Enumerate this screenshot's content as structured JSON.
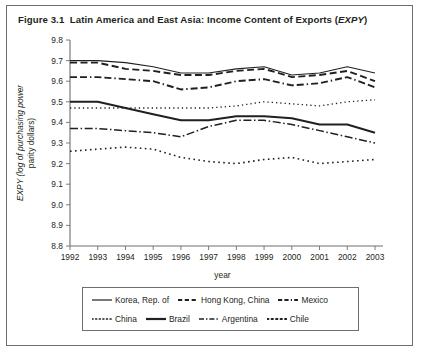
{
  "figure": {
    "label": "Figure 3.1",
    "title_main": "Latin America and East Asia: Income Content of Exports (",
    "title_italic": "EXPY",
    "title_close": ")"
  },
  "axes": {
    "ylabel_line1": "EXPY (log of purchasing power",
    "ylabel_line2": "parity dollars)",
    "xlabel": "year"
  },
  "chart_data": {
    "type": "line",
    "xlabel": "year",
    "ylabel": "EXPY (log of purchasing power parity dollars)",
    "x": [
      1992,
      1993,
      1994,
      1995,
      1996,
      1997,
      1998,
      1999,
      2000,
      2001,
      2002,
      2003
    ],
    "xlim": [
      1992,
      2003
    ],
    "ylim": [
      8.8,
      9.8
    ],
    "yticks": [
      8.8,
      8.9,
      9.0,
      9.1,
      9.2,
      9.3,
      9.4,
      9.5,
      9.6,
      9.7,
      9.8
    ],
    "xticks": [
      1992,
      1993,
      1994,
      1995,
      1996,
      1997,
      1998,
      1999,
      2000,
      2001,
      2002,
      2003
    ],
    "grid": false,
    "legend_position": "below-axes",
    "series": [
      {
        "name": "Korea, Rep. of",
        "style": "solid",
        "width": 1.1,
        "values": [
          9.7,
          9.7,
          9.69,
          9.67,
          9.64,
          9.64,
          9.66,
          9.67,
          9.63,
          9.64,
          9.67,
          9.64
        ]
      },
      {
        "name": "Hong Kong, China",
        "style": "dashed",
        "width": 1.9,
        "values": [
          9.69,
          9.69,
          9.66,
          9.65,
          9.63,
          9.63,
          9.65,
          9.66,
          9.62,
          9.63,
          9.65,
          9.6
        ]
      },
      {
        "name": "Mexico",
        "style": "dash-dash-dot",
        "width": 1.9,
        "values": [
          9.62,
          9.62,
          9.61,
          9.6,
          9.56,
          9.57,
          9.6,
          9.61,
          9.58,
          9.59,
          9.62,
          9.57
        ]
      },
      {
        "name": "China",
        "style": "dotted",
        "width": 1.3,
        "values": [
          9.47,
          9.47,
          9.47,
          9.47,
          9.47,
          9.47,
          9.48,
          9.5,
          9.49,
          9.48,
          9.5,
          9.51
        ]
      },
      {
        "name": "Brazil",
        "style": "solid",
        "width": 2.0,
        "values": [
          9.5,
          9.5,
          9.47,
          9.44,
          9.41,
          9.41,
          9.43,
          9.43,
          9.42,
          9.39,
          9.39,
          9.35
        ]
      },
      {
        "name": "Argentina",
        "style": "dash-dot",
        "width": 1.5,
        "values": [
          9.37,
          9.37,
          9.36,
          9.35,
          9.33,
          9.38,
          9.41,
          9.41,
          9.39,
          9.36,
          9.33,
          9.3
        ]
      },
      {
        "name": "Chile",
        "style": "dotted-round",
        "width": 1.6,
        "values": [
          9.26,
          9.27,
          9.28,
          9.27,
          9.23,
          9.21,
          9.2,
          9.22,
          9.23,
          9.2,
          9.21,
          9.22
        ]
      }
    ]
  },
  "legend": {
    "rows": [
      [
        {
          "label": "Korea, Rep. of",
          "style": "solid-thin"
        },
        {
          "label": "Hong Kong, China",
          "style": "dashed"
        },
        {
          "label": "Mexico",
          "style": "dash-dash-dot"
        }
      ],
      [
        {
          "label": "China",
          "style": "dotted"
        },
        {
          "label": "Brazil",
          "style": "solid-thick"
        },
        {
          "label": "Argentina",
          "style": "dash-dot"
        },
        {
          "label": "Chile",
          "style": "dotted-round"
        }
      ]
    ]
  },
  "colors": {
    "ink": "#231f20",
    "rule": "#6d6e71",
    "background": "#ffffff"
  }
}
